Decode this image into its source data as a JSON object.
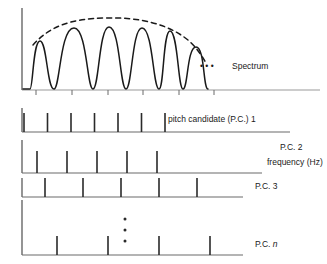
{
  "figure": {
    "title": "",
    "colors": {
      "line": "#1a1a1a",
      "axis": "#4d4d4d",
      "background": "#ffffff",
      "text": "#1a1a1a"
    }
  },
  "spectrum_panel": {
    "name": "spectrum",
    "label": "Spectrum",
    "ellipsis": "• • •",
    "label_x": 232,
    "label_y": 66,
    "ellipsis_x": 200,
    "ellipsis_y": 66,
    "axis": {
      "x0": 22,
      "y0": 90,
      "x1": 320,
      "y1": 90,
      "vertical_top": 8,
      "tick_length": 5,
      "tick_positions": [
        36,
        72,
        108,
        143,
        179,
        214
      ],
      "grid": false
    },
    "envelope": {
      "style": "dashed",
      "dash": "5,4",
      "points": "33,42 60,28 100,20 140,20 175,28 200,48 205,62"
    },
    "harmonics": {
      "count": 6,
      "peak_x": [
        40,
        74,
        108,
        142,
        170,
        196
      ],
      "peak_top_y": [
        40,
        26,
        25,
        26,
        30,
        46
      ],
      "baseline_y": 89
    }
  },
  "candidate_panels": [
    {
      "id": "pc1",
      "label": "pitch candidate (P.C.) 1",
      "label_x": 168,
      "label_y": 120,
      "axis_y": 132,
      "axis_x0": 22,
      "axis_x1": 290,
      "vertical_top": 108,
      "spacing": 23.5,
      "tick_count": 7,
      "tick_height": 19,
      "ticks": [
        24,
        47.5,
        71,
        94.5,
        118,
        141.5,
        165
      ]
    },
    {
      "id": "pc2",
      "label": "P.C. 2",
      "sublabel": "frequency (Hz)",
      "label_x": 280,
      "label_y": 147,
      "sublabel_x": 271,
      "sublabel_y": 162,
      "axis_y": 173,
      "axis_x0": 22,
      "axis_x1": 262,
      "vertical_top": 140,
      "spacing": 30,
      "tick_count": 5,
      "tick_height": 19,
      "ticks": [
        37,
        67,
        97,
        127,
        157
      ]
    },
    {
      "id": "pc3",
      "label": "P.C. 3",
      "label_x": 255,
      "label_y": 186,
      "axis_y": 197,
      "axis_x0": 22,
      "axis_x1": 243,
      "vertical_top": 178,
      "spacing": 38,
      "tick_count": 5,
      "tick_height": 19,
      "ticks": [
        45,
        83,
        121,
        159,
        197
      ]
    },
    {
      "id": "pcn",
      "label": "P.C. ",
      "label_italic": "n",
      "label_x": 255,
      "label_y": 244,
      "axis_y": 255,
      "axis_x0": 22,
      "axis_x1": 243,
      "vertical_top": 200,
      "spacing": 51,
      "tick_count": 4,
      "tick_height": 19,
      "ticks": [
        57,
        108,
        159,
        210
      ],
      "vertical_ellipsis": {
        "x": 125,
        "dot_ys": [
          219,
          230,
          241
        ],
        "dot_r": 1.4
      }
    }
  ]
}
